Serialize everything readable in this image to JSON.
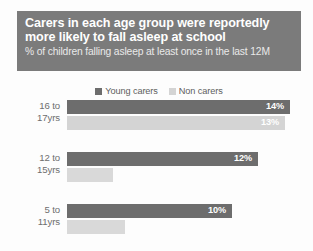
{
  "header": {
    "title": "Carers in each age group were reportedly\nmore likely to fall asleep at school",
    "subtitle": "% of children falling asleep at least once in the last 12M",
    "background_color": "#7b7b7b",
    "title_color": "#ffffff"
  },
  "legend": {
    "position": "top-center",
    "entries": [
      {
        "label": "Young carers",
        "color": "#6d6d6d",
        "swatch_name": "legend-swatch-young-carers"
      },
      {
        "label": "Non carers",
        "color": "#d4d4d4",
        "swatch_name": "legend-swatch-non-carers"
      }
    ]
  },
  "chart_data": {
    "type": "bar",
    "orientation": "horizontal",
    "title": "Carers in each age group were reportedly more likely to fall asleep at school",
    "subtitle": "% of children falling asleep at least once in the last 12M",
    "xlabel": "",
    "ylabel": "",
    "xlim": [
      0,
      16
    ],
    "grid": false,
    "legend_position": "top-center",
    "categories": [
      "16 to\n17yrs",
      "12 to\n15yrs",
      "5 to\n11yrs"
    ],
    "series": [
      {
        "name": "Young carers",
        "color": "#6d6d6d",
        "values": [
          14,
          12,
          10
        ],
        "labels": [
          "14%",
          "12%",
          "10%"
        ]
      },
      {
        "name": "Non carers",
        "color": "#d4d4d4",
        "values": [
          13,
          3,
          4
        ],
        "labels": [
          "13%",
          "",
          ""
        ]
      }
    ]
  },
  "groups": [
    {
      "label": "16 to\n17yrs",
      "young": {
        "value_label": "14%",
        "bar_width_px": 223,
        "color": "#6d6d6d"
      },
      "non": {
        "value_label": "13%",
        "bar_width_px": 218,
        "color": "#d4d4d4"
      }
    },
    {
      "label": "12 to\n15yrs",
      "young": {
        "value_label": "12%",
        "bar_width_px": 191,
        "color": "#6d6d6d"
      },
      "non": {
        "value_label": "",
        "bar_width_px": 46,
        "color": "#d9d9d9"
      }
    },
    {
      "label": "5 to\n11yrs",
      "young": {
        "value_label": "10%",
        "bar_width_px": 165,
        "color": "#6d6d6d"
      },
      "non": {
        "value_label": "",
        "bar_width_px": 58,
        "color": "#d9d9d9"
      }
    }
  ]
}
